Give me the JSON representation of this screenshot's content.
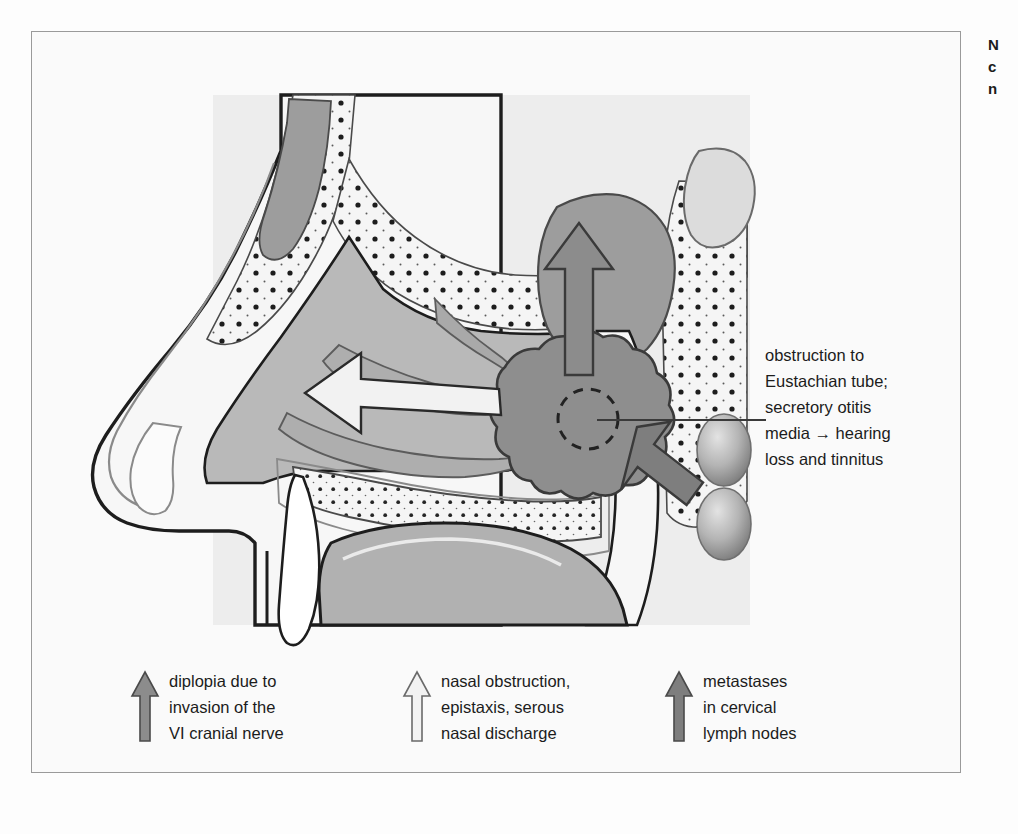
{
  "figure": {
    "caption_lines": [
      "N",
      "c",
      "n"
    ],
    "background_color": "#fdfdfd",
    "panel_color": "#ededed",
    "frame_border_color": "#9a9a9a"
  },
  "annotation": {
    "name": "eustachian-tube-obstruction-callout",
    "lines": [
      "obstruction to",
      "Eustachian tube;",
      "secretory otitis",
      "media → hearing",
      "loss and tinnitus"
    ],
    "leader_line_color": "#3a3a3a"
  },
  "illustration": {
    "title": "sagittal section of head showing nasopharyngeal tumour",
    "structures": [
      {
        "name": "frontal-sinus",
        "fill": "#9d9d9d"
      },
      {
        "name": "cranial-bone-stipple",
        "fill": "#f4f4f4"
      },
      {
        "name": "nasal-cavity",
        "fill": "#b9b9b9"
      },
      {
        "name": "turbinates",
        "fill": "#b3b3b3"
      },
      {
        "name": "sphenoid-sinus",
        "fill": "#9d9d9d"
      },
      {
        "name": "tumour-mass",
        "fill": "#8e8e8e"
      },
      {
        "name": "eustachian-tube-opening",
        "fill": "none"
      },
      {
        "name": "hard-palate",
        "fill": "#f4f4f4"
      },
      {
        "name": "incisor-tooth",
        "fill": "#ffffff"
      },
      {
        "name": "tongue",
        "fill": "#b1b1b1"
      },
      {
        "name": "cervical-lymph-node-upper",
        "fill": "#9a9a9a"
      },
      {
        "name": "cervical-lymph-node-lower",
        "fill": "#9a9a9a"
      }
    ],
    "arrows": [
      {
        "name": "arrow-superior-spread",
        "direction": "up",
        "fill": "#8c8c8c",
        "meaning": "diplopia due to invasion of the VI cranial nerve"
      },
      {
        "name": "arrow-anterior-nasal",
        "direction": "left",
        "fill": "#f2f2f2",
        "meaning": "nasal obstruction, epistaxis, serous nasal discharge"
      },
      {
        "name": "arrow-lymphatic-spread",
        "direction": "down-right",
        "fill": "#7e7e7e",
        "meaning": "metastases in cervical lymph nodes"
      }
    ]
  },
  "legend": {
    "items": [
      {
        "name": "legend-diplopia",
        "arrow_color": "#8c8c8c",
        "arrow_stroke": "#4a4a4a",
        "lines": [
          "diplopia due to",
          "invasion of the",
          "VI cranial nerve"
        ]
      },
      {
        "name": "legend-nasal-obstruction",
        "arrow_color": "#f2f2f2",
        "arrow_stroke": "#6a6a6a",
        "lines": [
          "nasal obstruction,",
          "epistaxis, serous",
          "nasal discharge"
        ]
      },
      {
        "name": "legend-metastases",
        "arrow_color": "#7e7e7e",
        "arrow_stroke": "#4a4a4a",
        "lines": [
          "metastases",
          "in cervical",
          "lymph nodes"
        ]
      }
    ]
  }
}
